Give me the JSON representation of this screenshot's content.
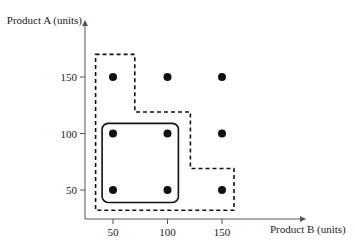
{
  "chart_data": {
    "type": "scatter",
    "title": "",
    "xlabel": "Product B (units)",
    "ylabel": "Product A (units)",
    "xticks": [
      50,
      100,
      150
    ],
    "yticks": [
      50,
      100,
      150
    ],
    "grid": false,
    "points": [
      {
        "x": 50,
        "y": 150
      },
      {
        "x": 100,
        "y": 150
      },
      {
        "x": 150,
        "y": 150
      },
      {
        "x": 50,
        "y": 100
      },
      {
        "x": 100,
        "y": 100
      },
      {
        "x": 150,
        "y": 100
      },
      {
        "x": 50,
        "y": 50
      },
      {
        "x": 100,
        "y": 50
      },
      {
        "x": 150,
        "y": 50
      }
    ],
    "regions": [
      {
        "name": "solid-rounded-box",
        "style": "solid",
        "x_range": [
          40,
          110
        ],
        "y_range": [
          39,
          109
        ]
      },
      {
        "name": "dashed-staircase-region",
        "style": "dashed",
        "vertices": [
          [
            34,
            170
          ],
          [
            70,
            170
          ],
          [
            70,
            119
          ],
          [
            121,
            119
          ],
          [
            121,
            69
          ],
          [
            161,
            69
          ],
          [
            161,
            32
          ],
          [
            34,
            32
          ]
        ]
      }
    ]
  },
  "colors": {
    "ink": "#111111",
    "axis": "#555555",
    "background": "#ffffff"
  }
}
